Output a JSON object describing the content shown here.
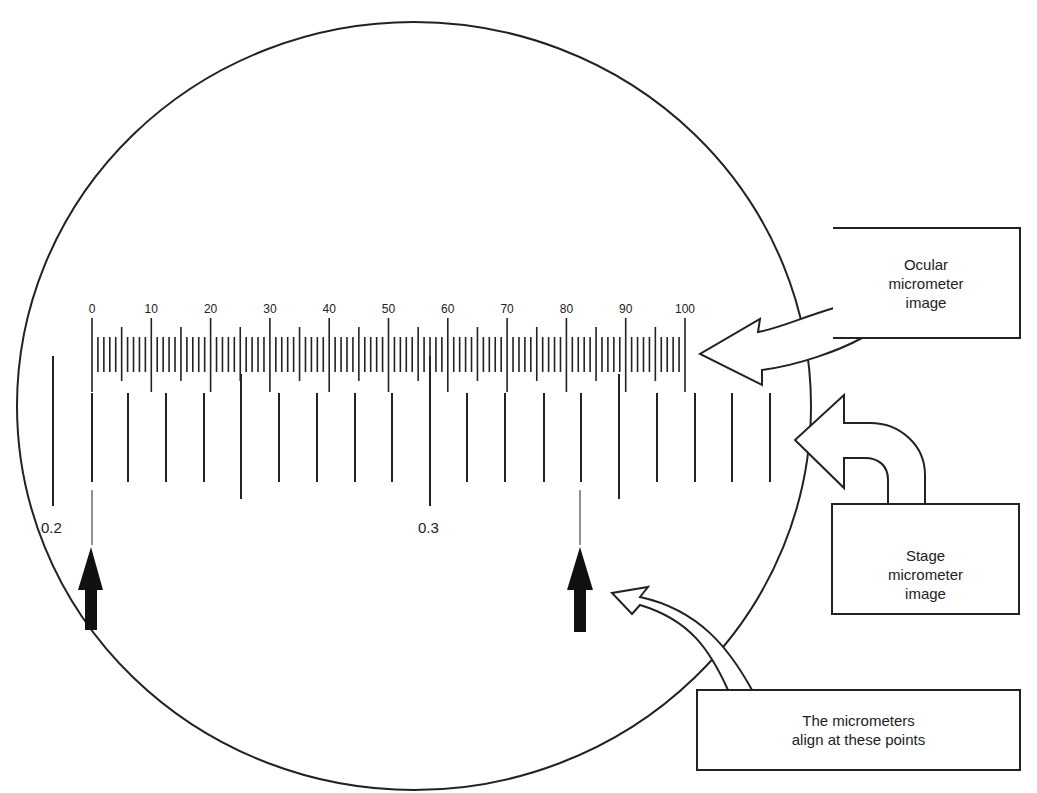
{
  "diagram": {
    "field_of_view": {
      "shape": "circle",
      "cx": 414,
      "cy": 406,
      "rx": 397,
      "ry": 384,
      "stroke": "#222222"
    },
    "ocular_micrometer": {
      "labels": [
        "0",
        "10",
        "20",
        "30",
        "40",
        "50",
        "60",
        "70",
        "80",
        "90",
        "100"
      ],
      "start_x": 92,
      "end_x": 685,
      "divisions": 100
    },
    "stage_micrometer": {
      "label_left": "0.2",
      "label_mid": "0.3",
      "line_x": [
        53,
        92,
        128,
        166,
        204,
        241,
        279,
        317,
        355,
        392,
        430,
        467,
        505,
        544,
        581,
        619,
        657,
        695,
        732,
        770
      ],
      "long_line_x": [
        241,
        619
      ],
      "labeled_line_x": [
        53,
        430
      ]
    },
    "alignment_arrows": [
      {
        "x": 92,
        "name": "left-alignment-arrow"
      },
      {
        "x": 581,
        "name": "right-alignment-arrow"
      }
    ],
    "callouts": {
      "ocular": "Ocular\nmicrometer\nimage",
      "stage": "Stage\nmicrometer\nimage",
      "align": "The micrometers\nalign at these points"
    }
  }
}
